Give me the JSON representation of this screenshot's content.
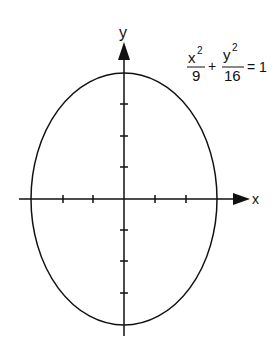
{
  "diagram": {
    "type": "ellipse-graph",
    "equation": {
      "term1_num": "x",
      "term1_exp": "2",
      "term1_den": "9",
      "plus": "+",
      "term2_num": "y",
      "term2_exp": "2",
      "term2_den": "16",
      "equals": "= 1"
    },
    "axes": {
      "x_label": "x",
      "y_label": "y",
      "x_ticks": [
        -3,
        -2,
        -1,
        1,
        2,
        3
      ],
      "y_ticks": [
        -4,
        -3,
        -2,
        -1,
        1,
        2,
        3,
        4
      ]
    },
    "ellipse": {
      "a": 3,
      "b": 4,
      "center": [
        0,
        0
      ]
    },
    "colors": {
      "stroke": "#111111",
      "background": "#ffffff"
    }
  }
}
